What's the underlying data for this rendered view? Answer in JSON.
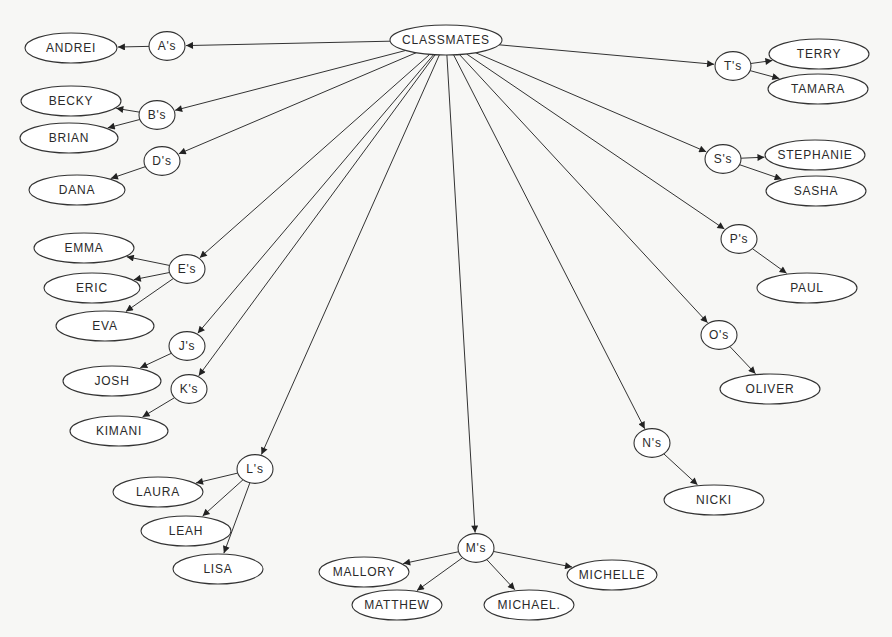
{
  "diagram": {
    "root": {
      "label": "CLASSMATES",
      "x": 446,
      "y": 40,
      "rx": 56,
      "ry": 15
    },
    "groups": [
      {
        "id": "A",
        "label": "A's",
        "x": 167,
        "y": 46,
        "r": 18,
        "children": [
          {
            "label": "ANDREI",
            "x": 71,
            "y": 48,
            "rx": 46,
            "ry": 15
          }
        ]
      },
      {
        "id": "B",
        "label": "B's",
        "x": 157,
        "y": 115,
        "r": 18,
        "children": [
          {
            "label": "BECKY",
            "x": 71,
            "y": 101,
            "rx": 50,
            "ry": 15
          },
          {
            "label": "BRIAN",
            "x": 69,
            "y": 138,
            "rx": 49,
            "ry": 15
          }
        ]
      },
      {
        "id": "D",
        "label": "D's",
        "x": 162,
        "y": 161,
        "r": 18,
        "children": [
          {
            "label": "DANA",
            "x": 77,
            "y": 190,
            "rx": 48,
            "ry": 15
          }
        ]
      },
      {
        "id": "E",
        "label": "E's",
        "x": 187,
        "y": 269,
        "r": 18,
        "children": [
          {
            "label": "EMMA",
            "x": 84,
            "y": 248,
            "rx": 50,
            "ry": 15
          },
          {
            "label": "ERIC",
            "x": 92,
            "y": 288,
            "rx": 48,
            "ry": 15
          },
          {
            "label": "EVA",
            "x": 105,
            "y": 326,
            "rx": 49,
            "ry": 15
          }
        ]
      },
      {
        "id": "J",
        "label": "J's",
        "x": 187,
        "y": 346,
        "r": 18,
        "children": [
          {
            "label": "JOSH",
            "x": 112,
            "y": 381,
            "rx": 49,
            "ry": 15
          }
        ]
      },
      {
        "id": "K",
        "label": "K's",
        "x": 189,
        "y": 389,
        "r": 18,
        "children": [
          {
            "label": "KIMANI",
            "x": 119,
            "y": 431,
            "rx": 49,
            "ry": 15
          }
        ]
      },
      {
        "id": "L",
        "label": "L's",
        "x": 255,
        "y": 469,
        "r": 18,
        "children": [
          {
            "label": "LAURA",
            "x": 158,
            "y": 492,
            "rx": 45,
            "ry": 15
          },
          {
            "label": "LEAH",
            "x": 186,
            "y": 531,
            "rx": 45,
            "ry": 15
          },
          {
            "label": "LISA",
            "x": 218,
            "y": 569,
            "rx": 45,
            "ry": 15
          }
        ]
      },
      {
        "id": "M",
        "label": "M's",
        "x": 476,
        "y": 548,
        "r": 18,
        "children": [
          {
            "label": "MALLORY",
            "x": 364,
            "y": 572,
            "rx": 45,
            "ry": 15
          },
          {
            "label": "MATTHEW",
            "x": 397,
            "y": 605,
            "rx": 45,
            "ry": 15
          },
          {
            "label": "MICHAEL.",
            "x": 529,
            "y": 605,
            "rx": 45,
            "ry": 15
          },
          {
            "label": "MICHELLE",
            "x": 612,
            "y": 575,
            "rx": 45,
            "ry": 15
          }
        ]
      },
      {
        "id": "N",
        "label": "N's",
        "x": 652,
        "y": 443,
        "r": 18,
        "children": [
          {
            "label": "NICKI",
            "x": 714,
            "y": 500,
            "rx": 50,
            "ry": 15
          }
        ]
      },
      {
        "id": "O",
        "label": "O's",
        "x": 719,
        "y": 335,
        "r": 18,
        "children": [
          {
            "label": "OLIVER",
            "x": 770,
            "y": 389,
            "rx": 50,
            "ry": 15
          }
        ]
      },
      {
        "id": "P",
        "label": "P's",
        "x": 739,
        "y": 239,
        "r": 18,
        "children": [
          {
            "label": "PAUL",
            "x": 807,
            "y": 288,
            "rx": 50,
            "ry": 15
          }
        ]
      },
      {
        "id": "S",
        "label": "S's",
        "x": 723,
        "y": 159,
        "r": 18,
        "children": [
          {
            "label": "STEPHANIE",
            "x": 815,
            "y": 155,
            "rx": 50,
            "ry": 15
          },
          {
            "label": "SASHA",
            "x": 816,
            "y": 191,
            "rx": 50,
            "ry": 15
          }
        ]
      },
      {
        "id": "T",
        "label": "T's",
        "x": 733,
        "y": 66,
        "r": 18,
        "children": [
          {
            "label": "TERRY",
            "x": 819,
            "y": 54,
            "rx": 50,
            "ry": 15
          },
          {
            "label": "TAMARA",
            "x": 818,
            "y": 89,
            "rx": 50,
            "ry": 15
          }
        ]
      }
    ],
    "colors": {
      "stroke": "#333333",
      "background": "#f7f7f5",
      "node_fill": "#ffffff"
    }
  }
}
